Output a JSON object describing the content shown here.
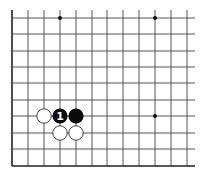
{
  "board": {
    "description": "Go board fragment (bottom-left corner region), top and right sides cut off",
    "colors": {
      "background": "#ffffff",
      "line": "#444444",
      "edge_line": "#222222",
      "black_stone": "#0a0a0a",
      "white_stone": "#ffffff",
      "white_stone_border": "#333333",
      "star_point": "#111111",
      "marker": "#ffffff"
    },
    "grid": {
      "columns_x": [
        12,
        28,
        44,
        60,
        76,
        92,
        107,
        123,
        139,
        155,
        171,
        187
      ],
      "rows_y": [
        18,
        34,
        51,
        67,
        83,
        100,
        116,
        133,
        149,
        166
      ],
      "left_edge_x": 12,
      "bottom_edge_y": 166,
      "line_extent_right": 195,
      "line_extent_top": 10,
      "line_extent_bottom_cut": 177
    },
    "star_points": [
      {
        "col": 3,
        "row": 0
      },
      {
        "col": 9,
        "row": 0
      },
      {
        "col": 9,
        "row": 6
      }
    ],
    "stones": [
      {
        "color": "white",
        "col": 2,
        "row": 6
      },
      {
        "color": "black",
        "col": 3,
        "row": 6,
        "marker": "1"
      },
      {
        "color": "black",
        "col": 4,
        "row": 6
      },
      {
        "color": "white",
        "col": 3,
        "row": 7
      },
      {
        "color": "white",
        "col": 4,
        "row": 7
      }
    ],
    "stone_radius": 7.6
  },
  "caption": ""
}
